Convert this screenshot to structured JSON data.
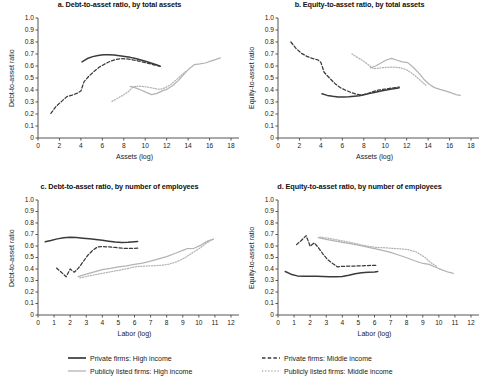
{
  "figure": {
    "legend": [
      {
        "id": "private-high",
        "label": "Private firms: High income",
        "color": "#3a3a3a",
        "style": "solid"
      },
      {
        "id": "private-mid",
        "label": "Private firms: Middle income",
        "color": "#3a3a3a",
        "style": "dashed"
      },
      {
        "id": "public-high",
        "label": "Publicly listed firms: High income",
        "color": "#b3b3b3",
        "style": "solid"
      },
      {
        "id": "public-mid",
        "label": "Publicly listed firms: Middle income",
        "color": "#b3b3b3",
        "style": "dotted"
      }
    ]
  },
  "chart_data": [
    {
      "id": "panel-a",
      "type": "line",
      "title": "a. Debt-to-asset ratio, by total assets",
      "xlabel": "Assets (log)",
      "ylabel": "Debt-to-asset ratio",
      "xlim": [
        0,
        18
      ],
      "ylim": [
        0,
        1.0
      ],
      "xticks": [
        0,
        2,
        4,
        6,
        8,
        10,
        12,
        14,
        16,
        18
      ],
      "yticks": [
        "0",
        "0.1",
        "0.2",
        "0.3",
        "0.4",
        "0.5",
        "0.6",
        "0.7",
        "0.8",
        "0.9",
        "1.0"
      ],
      "grid": false,
      "series": [
        {
          "name": "Private firms: High income",
          "style": "solid",
          "color": "#3a3a3a",
          "x": [
            4.1,
            4.6,
            5.1,
            5.6,
            6.1,
            6.6,
            7.1,
            7.6,
            8.1,
            8.6,
            9.1,
            9.6,
            10.1,
            10.6,
            11.1,
            11.4
          ],
          "y": [
            0.635,
            0.662,
            0.678,
            0.688,
            0.693,
            0.694,
            0.691,
            0.686,
            0.68,
            0.672,
            0.662,
            0.65,
            0.637,
            0.623,
            0.608,
            0.598
          ]
        },
        {
          "name": "Private firms: Middle income",
          "style": "dashed",
          "color": "#3a3a3a",
          "x": [
            1.2,
            1.7,
            2.2,
            2.7,
            3.2,
            3.7,
            4.0,
            4.3,
            4.8,
            5.3,
            5.8,
            6.3,
            6.8,
            7.3,
            7.8,
            8.3,
            8.8,
            9.3,
            9.8,
            10.3,
            10.8,
            11.3
          ],
          "y": [
            0.205,
            0.265,
            0.305,
            0.345,
            0.358,
            0.375,
            0.392,
            0.47,
            0.52,
            0.56,
            0.595,
            0.62,
            0.642,
            0.655,
            0.661,
            0.659,
            0.652,
            0.643,
            0.633,
            0.622,
            0.61,
            0.6
          ]
        },
        {
          "name": "Publicly listed firms: High income",
          "style": "solid",
          "color": "#b3b3b3",
          "x": [
            8.6,
            9.1,
            9.6,
            10.1,
            10.6,
            11.1,
            11.6,
            12.1,
            12.6,
            13.1,
            13.6,
            14.1,
            14.6,
            15.1,
            15.6,
            16.1,
            16.6,
            17.0
          ],
          "y": [
            0.43,
            0.418,
            0.4,
            0.38,
            0.362,
            0.372,
            0.393,
            0.41,
            0.44,
            0.48,
            0.53,
            0.578,
            0.612,
            0.617,
            0.625,
            0.64,
            0.655,
            0.668
          ]
        },
        {
          "name": "Publicly listed firms: Middle income",
          "style": "dotted",
          "color": "#b3b3b3",
          "x": [
            6.9,
            7.4,
            7.9,
            8.4,
            8.9,
            9.4,
            9.9,
            10.4,
            10.9,
            11.4,
            11.9,
            12.4,
            12.9,
            13.4,
            13.8
          ],
          "y": [
            0.305,
            0.33,
            0.355,
            0.385,
            0.428,
            0.432,
            0.428,
            0.422,
            0.413,
            0.405,
            0.42,
            0.448,
            0.485,
            0.525,
            0.555
          ]
        }
      ]
    },
    {
      "id": "panel-b",
      "type": "line",
      "title": "b. Equity-to-asset ratio, by total assets",
      "xlabel": "Assets (log)",
      "ylabel": "Equity-to-asset ratio",
      "xlim": [
        0,
        18
      ],
      "ylim": [
        0,
        1.0
      ],
      "xticks": [
        0,
        2,
        4,
        6,
        8,
        10,
        12,
        14,
        16,
        18
      ],
      "yticks": [
        "0",
        "0.1",
        "0.2",
        "0.3",
        "0.4",
        "0.5",
        "0.6",
        "0.7",
        "0.8",
        "0.9",
        "1.0"
      ],
      "grid": false,
      "series": [
        {
          "name": "Private firms: High income",
          "style": "solid",
          "color": "#3a3a3a",
          "x": [
            4.1,
            4.6,
            5.1,
            5.6,
            6.1,
            6.6,
            7.1,
            7.6,
            8.1,
            8.6,
            9.1,
            9.6,
            10.1,
            10.6,
            11.1,
            11.3
          ],
          "y": [
            0.368,
            0.355,
            0.347,
            0.342,
            0.341,
            0.343,
            0.348,
            0.353,
            0.362,
            0.372,
            0.382,
            0.392,
            0.4,
            0.408,
            0.415,
            0.418
          ]
        },
        {
          "name": "Private firms: Middle income",
          "style": "dashed",
          "color": "#3a3a3a",
          "x": [
            1.2,
            1.7,
            2.2,
            2.7,
            3.2,
            3.7,
            4.0,
            4.3,
            4.8,
            5.3,
            5.8,
            6.3,
            6.8,
            7.3,
            7.8,
            8.3,
            8.8,
            9.3,
            9.8,
            10.3,
            10.8,
            11.3
          ],
          "y": [
            0.8,
            0.745,
            0.705,
            0.68,
            0.663,
            0.652,
            0.63,
            0.548,
            0.5,
            0.455,
            0.42,
            0.398,
            0.38,
            0.365,
            0.358,
            0.368,
            0.385,
            0.398,
            0.405,
            0.412,
            0.418,
            0.425
          ]
        },
        {
          "name": "Publicly listed firms: High income",
          "style": "solid",
          "color": "#b3b3b3",
          "x": [
            8.6,
            9.1,
            9.6,
            10.1,
            10.6,
            11.1,
            11.6,
            12.1,
            12.6,
            13.1,
            13.6,
            14.1,
            14.6,
            15.1,
            15.6,
            16.1,
            16.6,
            17.0
          ],
          "y": [
            0.585,
            0.6,
            0.625,
            0.65,
            0.663,
            0.648,
            0.635,
            0.628,
            0.59,
            0.545,
            0.49,
            0.448,
            0.42,
            0.405,
            0.392,
            0.378,
            0.362,
            0.355
          ]
        },
        {
          "name": "Publicly listed firms: Middle income",
          "style": "dotted",
          "color": "#b3b3b3",
          "x": [
            6.9,
            7.4,
            7.9,
            8.4,
            8.9,
            9.4,
            9.9,
            10.4,
            10.9,
            11.4,
            11.9,
            12.4,
            12.9,
            13.4,
            13.8
          ],
          "y": [
            0.7,
            0.672,
            0.645,
            0.612,
            0.578,
            0.582,
            0.588,
            0.59,
            0.59,
            0.585,
            0.572,
            0.545,
            0.51,
            0.47,
            0.44
          ]
        }
      ]
    },
    {
      "id": "panel-c",
      "type": "line",
      "title": "c. Debt-to-asset ratio, by number of employees",
      "xlabel": "Labor (log)",
      "ylabel": "Debt-to-asset ratio",
      "xlim": [
        0,
        12
      ],
      "ylim": [
        0,
        1.0
      ],
      "xticks": [
        0,
        1,
        2,
        3,
        4,
        5,
        6,
        7,
        8,
        9,
        10,
        11,
        12
      ],
      "yticks": [
        "0",
        "0.1",
        "0.2",
        "0.3",
        "0.4",
        "0.5",
        "0.6",
        "0.7",
        "0.8",
        "0.9",
        "1.0"
      ],
      "grid": false,
      "series": [
        {
          "name": "Private firms: High income",
          "style": "solid",
          "color": "#3a3a3a",
          "x": [
            0.45,
            0.8,
            1.2,
            1.6,
            2.0,
            2.4,
            2.8,
            3.2,
            3.6,
            4.0,
            4.4,
            4.8,
            5.2,
            5.6,
            6.0,
            6.2
          ],
          "y": [
            0.637,
            0.648,
            0.662,
            0.672,
            0.676,
            0.673,
            0.668,
            0.663,
            0.657,
            0.65,
            0.642,
            0.634,
            0.63,
            0.633,
            0.638,
            0.64
          ]
        },
        {
          "name": "Private firms: Middle income",
          "style": "dashed",
          "color": "#3a3a3a",
          "x": [
            1.15,
            1.45,
            1.75,
            2.0,
            2.25,
            2.5,
            2.8,
            3.1,
            3.4,
            3.7,
            4.0,
            4.4,
            4.8,
            5.2,
            5.6,
            6.0,
            6.2
          ],
          "y": [
            0.408,
            0.372,
            0.332,
            0.4,
            0.372,
            0.405,
            0.462,
            0.52,
            0.562,
            0.592,
            0.596,
            0.592,
            0.588,
            0.582,
            0.578,
            0.58,
            0.582
          ]
        },
        {
          "name": "Publicly listed firms: High income",
          "style": "solid",
          "color": "#b3b3b3",
          "x": [
            2.5,
            3.0,
            3.5,
            4.0,
            4.5,
            5.0,
            5.5,
            6.0,
            6.5,
            7.0,
            7.5,
            8.0,
            8.5,
            9.0,
            9.3,
            9.7,
            10.1,
            10.5,
            10.9
          ],
          "y": [
            0.333,
            0.355,
            0.375,
            0.395,
            0.405,
            0.418,
            0.428,
            0.44,
            0.452,
            0.468,
            0.488,
            0.508,
            0.535,
            0.562,
            0.578,
            0.58,
            0.605,
            0.64,
            0.66
          ]
        },
        {
          "name": "Publicly listed firms: Middle income",
          "style": "dotted",
          "color": "#b3b3b3",
          "x": [
            2.6,
            3.1,
            3.6,
            4.1,
            4.6,
            5.1,
            5.6,
            6.1,
            6.6,
            7.1,
            7.6,
            8.1,
            8.6,
            9.1,
            9.6,
            10.1,
            10.5,
            10.9
          ],
          "y": [
            0.322,
            0.338,
            0.352,
            0.365,
            0.378,
            0.39,
            0.405,
            0.42,
            0.425,
            0.428,
            0.432,
            0.44,
            0.462,
            0.495,
            0.54,
            0.585,
            0.628,
            0.66
          ]
        }
      ]
    },
    {
      "id": "panel-d",
      "type": "line",
      "title": "d. Equity-to-asset ratio, by number of employees",
      "xlabel": "Labor (log)",
      "ylabel": "Equity-to-asset ratio",
      "xlim": [
        0,
        12
      ],
      "ylim": [
        0,
        1.0
      ],
      "xticks": [
        0,
        1,
        2,
        3,
        4,
        5,
        6,
        7,
        8,
        9,
        10,
        11,
        12
      ],
      "yticks": [
        "0",
        "0.1",
        "0.2",
        "0.3",
        "0.4",
        "0.5",
        "0.6",
        "0.7",
        "0.8",
        "0.9",
        "1.0"
      ],
      "grid": false,
      "series": [
        {
          "name": "Private firms: High income",
          "style": "solid",
          "color": "#3a3a3a",
          "x": [
            0.45,
            0.8,
            1.2,
            1.6,
            2.0,
            2.4,
            2.8,
            3.2,
            3.6,
            4.0,
            4.4,
            4.8,
            5.2,
            5.6,
            6.0,
            6.2
          ],
          "y": [
            0.378,
            0.355,
            0.34,
            0.338,
            0.338,
            0.337,
            0.335,
            0.333,
            0.332,
            0.335,
            0.345,
            0.358,
            0.368,
            0.372,
            0.375,
            0.378
          ]
        },
        {
          "name": "Private firms: Middle income",
          "style": "dashed",
          "color": "#3a3a3a",
          "x": [
            1.15,
            1.45,
            1.75,
            2.0,
            2.25,
            2.5,
            2.8,
            3.1,
            3.4,
            3.7,
            4.0,
            4.4,
            4.8,
            5.2,
            5.6,
            6.0,
            6.2
          ],
          "y": [
            0.612,
            0.648,
            0.69,
            0.598,
            0.628,
            0.588,
            0.53,
            0.48,
            0.448,
            0.418,
            0.423,
            0.425,
            0.426,
            0.428,
            0.43,
            0.432,
            0.433
          ]
        },
        {
          "name": "Publicly listed firms: High income",
          "style": "solid",
          "color": "#b3b3b3",
          "x": [
            2.5,
            3.0,
            3.5,
            4.0,
            4.5,
            5.0,
            5.5,
            6.0,
            6.5,
            7.0,
            7.5,
            8.0,
            8.5,
            9.0,
            9.4,
            9.8,
            10.2,
            10.6,
            10.9
          ],
          "y": [
            0.672,
            0.658,
            0.645,
            0.632,
            0.62,
            0.608,
            0.593,
            0.578,
            0.562,
            0.545,
            0.522,
            0.498,
            0.472,
            0.448,
            0.44,
            0.415,
            0.392,
            0.372,
            0.362
          ]
        },
        {
          "name": "Publicly listed firms: Middle income",
          "style": "dotted",
          "color": "#b3b3b3",
          "x": [
            2.6,
            3.1,
            3.6,
            4.1,
            4.6,
            5.1,
            5.6,
            6.1,
            6.6,
            7.1,
            7.6,
            8.1,
            8.6,
            9.1,
            9.5,
            9.9
          ],
          "y": [
            0.678,
            0.668,
            0.655,
            0.642,
            0.628,
            0.612,
            0.598,
            0.588,
            0.585,
            0.58,
            0.575,
            0.568,
            0.548,
            0.505,
            0.455,
            0.42
          ]
        }
      ]
    }
  ]
}
